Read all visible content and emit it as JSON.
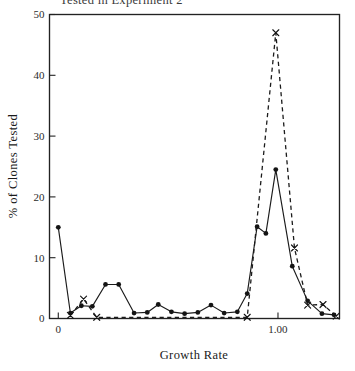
{
  "figure": {
    "title_partial": "Tested in Experiment 2",
    "width": 355,
    "height": 371
  },
  "chart_data": {
    "type": "line",
    "title": "",
    "xlabel": "Growth Rate",
    "ylabel": "% of Clones Tested",
    "xlim": [
      -0.04,
      1.28
    ],
    "ylim": [
      0,
      50
    ],
    "grid": false,
    "legend": "none",
    "xticks": [
      0,
      1.0
    ],
    "xticklabels": [
      "0",
      "1.00"
    ],
    "yticks": [
      0,
      10,
      20,
      30,
      40,
      50
    ],
    "yticklabels": [
      "0",
      "10",
      "20",
      "30",
      "40",
      "50"
    ],
    "series": [
      {
        "name": "solid-circles",
        "marker": "circle",
        "linestyle": "solid",
        "color": "#141414",
        "points": [
          [
            0.0,
            15.0
          ],
          [
            0.055,
            0.9
          ],
          [
            0.105,
            2.1
          ],
          [
            0.155,
            2.0
          ],
          [
            0.215,
            5.6
          ],
          [
            0.275,
            5.6
          ],
          [
            0.345,
            0.9
          ],
          [
            0.405,
            1.0
          ],
          [
            0.455,
            2.3
          ],
          [
            0.515,
            1.1
          ],
          [
            0.575,
            0.8
          ],
          [
            0.635,
            1.0
          ],
          [
            0.695,
            2.2
          ],
          [
            0.755,
            0.9
          ],
          [
            0.815,
            1.1
          ],
          [
            0.86,
            4.1
          ],
          [
            0.905,
            15.1
          ],
          [
            0.945,
            14.0
          ],
          [
            0.99,
            24.5
          ],
          [
            1.065,
            8.6
          ],
          [
            1.135,
            2.9
          ],
          [
            1.2,
            0.8
          ],
          [
            1.255,
            0.6
          ]
        ]
      },
      {
        "name": "dashed-x",
        "marker": "x",
        "linestyle": "dashed",
        "color": "#141414",
        "points": [
          [
            0.055,
            0.5
          ],
          [
            0.115,
            3.2
          ],
          [
            0.175,
            0.2
          ],
          [
            0.86,
            0.2
          ],
          [
            0.99,
            47.0
          ],
          [
            1.075,
            11.6
          ],
          [
            1.135,
            2.2
          ],
          [
            1.205,
            2.3
          ],
          [
            1.265,
            0.4
          ]
        ]
      }
    ]
  }
}
